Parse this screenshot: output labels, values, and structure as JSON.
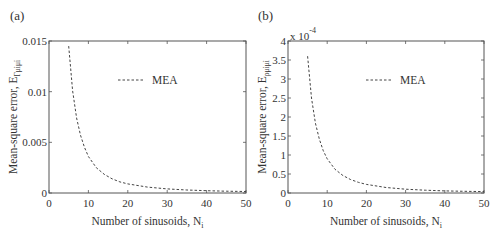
{
  "chart_data": [
    {
      "type": "line",
      "panel_label": "(a)",
      "xlabel": "Number of sinusoids, N",
      "xlabel_subscript": "i",
      "ylabel": "Mean-square error, E",
      "ylabel_subscript": "rμᵢμᵢ",
      "ylabel_sub_text": "Γμiμi",
      "xlim": [
        0,
        50
      ],
      "ylim": [
        0,
        0.015
      ],
      "xticks": [
        0,
        10,
        20,
        30,
        40,
        50
      ],
      "xtick_labels": [
        "0",
        "10",
        "20",
        "30",
        "40",
        "50"
      ],
      "yticks": [
        0,
        0.005,
        0.01,
        0.015
      ],
      "ytick_labels": [
        "0",
        "0.005",
        "0.01",
        "0.015"
      ],
      "y_multiplier": "",
      "grid": false,
      "legend_position": "top-right",
      "series": [
        {
          "name": "MEA",
          "style": "dashed",
          "x": [
            5,
            6,
            7,
            8,
            9,
            10,
            12,
            14,
            16,
            18,
            20,
            25,
            30,
            35,
            40,
            45,
            50
          ],
          "y": [
            0.0145,
            0.0101,
            0.0074,
            0.0057,
            0.0045,
            0.0036,
            0.0025,
            0.00185,
            0.0014,
            0.0011,
            0.0009,
            0.00058,
            0.0004,
            0.0003,
            0.00023,
            0.00018,
            0.00015
          ]
        }
      ]
    },
    {
      "type": "line",
      "panel_label": "(b)",
      "xlabel": "Number of sinusoids, N",
      "xlabel_subscript": "i",
      "ylabel": "Mean-square error, E",
      "ylabel_sub_text": "ρμiμi",
      "xlim": [
        0,
        50
      ],
      "ylim": [
        0,
        0.0004
      ],
      "xticks": [
        0,
        10,
        20,
        30,
        40,
        50
      ],
      "xtick_labels": [
        "0",
        "10",
        "20",
        "30",
        "40",
        "50"
      ],
      "yticks": [
        0,
        5e-05,
        0.0001,
        0.00015,
        0.0002,
        0.00025,
        0.0003,
        0.00035,
        0.0004
      ],
      "ytick_labels": [
        "0",
        "0.5",
        "1",
        "1.5",
        "2",
        "2.5",
        "3",
        "3.5",
        "4"
      ],
      "y_multiplier": "x 10",
      "y_multiplier_exp": "-4",
      "grid": false,
      "legend_position": "top-right",
      "series": [
        {
          "name": "MEA",
          "style": "dashed",
          "x": [
            5,
            6,
            7,
            8,
            9,
            10,
            12,
            14,
            16,
            18,
            20,
            25,
            30,
            35,
            40,
            45,
            50
          ],
          "y": [
            0.00036,
            0.00025,
            0.000184,
            0.000141,
            0.000111,
            9e-05,
            6.25e-05,
            4.6e-05,
            3.52e-05,
            2.78e-05,
            2.25e-05,
            1.44e-05,
            1e-05,
            7.3e-06,
            5.6e-06,
            4.4e-06,
            3.6e-06
          ]
        }
      ]
    }
  ]
}
